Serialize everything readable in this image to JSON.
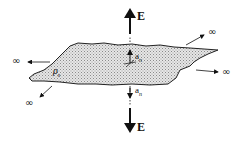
{
  "figure": {
    "labels": {
      "field_top": "E",
      "field_bottom": "E",
      "normal_top": "a",
      "normal_top_sub": "n",
      "normal_bottom": "a",
      "normal_bottom_sub": "n",
      "charge_density": "ρ",
      "charge_density_sub": "s",
      "infinity": "∞"
    },
    "infinity_markers": [
      {
        "position": "upper-right",
        "text": "∞"
      },
      {
        "position": "right",
        "text": "∞"
      },
      {
        "position": "left",
        "text": "∞"
      },
      {
        "position": "lower-left",
        "text": "∞"
      }
    ],
    "colors": {
      "ink": "#111111",
      "sheet_fill": "#d9d9d9",
      "background": "#ffffff"
    }
  }
}
